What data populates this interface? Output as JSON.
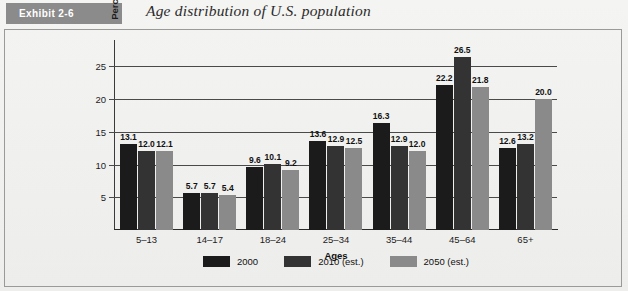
{
  "header": {
    "exhibit_label": "Exhibit 2-6",
    "title": "Age distribution of U.S. population",
    "tab_color": "#8b8b8b"
  },
  "chart_data": {
    "type": "bar",
    "title": "Age distribution of U.S. population",
    "xlabel": "Ages",
    "ylabel": "Percent of population",
    "ylim": [
      0,
      27.5
    ],
    "yticks": [
      5,
      10,
      15,
      20,
      25
    ],
    "ytick_labels": [
      "5",
      "10",
      "15",
      "20",
      "25"
    ],
    "grid": true,
    "legend_position": "bottom",
    "categories": [
      "5–13",
      "14–17",
      "18–24",
      "25–34",
      "35–44",
      "45–64",
      "65+"
    ],
    "series": [
      {
        "name": "2000",
        "color": "#1b1b1b",
        "values": [
          13.1,
          5.7,
          9.6,
          13.6,
          16.3,
          22.2,
          12.6
        ],
        "labels": [
          "13.1",
          "5.7",
          "9.6",
          "13.6",
          "16.3",
          "22.2",
          "12.6"
        ]
      },
      {
        "name": "2010 (est.)",
        "color": "#333333",
        "values": [
          12.0,
          5.7,
          10.1,
          12.9,
          12.9,
          26.5,
          13.2
        ],
        "labels": [
          "12.0",
          "5.7",
          "10.1",
          "12.9",
          "12.9",
          "26.5",
          "13.2"
        ]
      },
      {
        "name": "2050 (est.)",
        "color": "#8a8a8a",
        "values": [
          12.1,
          5.4,
          9.2,
          12.5,
          12.0,
          21.8,
          20.0
        ],
        "labels": [
          "12.1",
          "5.4",
          "9.2",
          "12.5",
          "12.0",
          "21.8",
          "20.0"
        ]
      }
    ]
  }
}
